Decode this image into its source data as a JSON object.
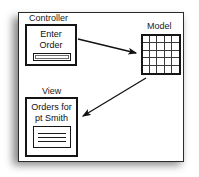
{
  "diagram": {
    "frame": {
      "border_color": "#2b2b2b",
      "background": "#ffffff",
      "shadow_color": "#6e6e6e"
    },
    "groups": [
      {
        "id": "controller",
        "label": "Controller"
      },
      {
        "id": "view",
        "label": "View"
      },
      {
        "id": "model",
        "label": "Model"
      }
    ],
    "widgets": {
      "enter_order": {
        "label_line1": "Enter",
        "label_line2": "Order",
        "field_name": "order-input-field"
      },
      "view_list": {
        "label_line1": "Orders for",
        "label_line2": "pt Smith",
        "line_count": 3
      },
      "model_grid": {
        "columns": 5,
        "rows": 5,
        "cell_border_color": "#3a3a3a"
      }
    },
    "arrows": [
      {
        "id": "controller-to-model",
        "from": "enter-order-box",
        "to": "model-grid",
        "label": "",
        "color": "#111111"
      },
      {
        "id": "model-to-view",
        "from": "model-grid",
        "to": "view-box",
        "label": "",
        "color": "#111111"
      }
    ]
  }
}
